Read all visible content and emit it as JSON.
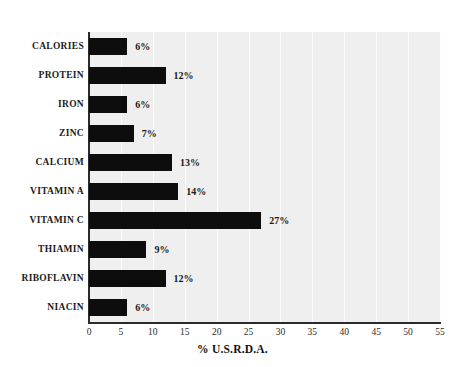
{
  "chart_data": {
    "type": "bar",
    "orientation": "horizontal",
    "title": "",
    "xlabel": "% U.S.R.D.A.",
    "ylabel": "",
    "xlim": [
      0,
      55
    ],
    "xticks": [
      0,
      5,
      10,
      15,
      20,
      25,
      30,
      35,
      40,
      45,
      50,
      55
    ],
    "grid": true,
    "grid_axis": "x",
    "legend": false,
    "categories": [
      "CALORIES",
      "PROTEIN",
      "IRON",
      "ZINC",
      "CALCIUM",
      "VITAMIN A",
      "VITAMIN C",
      "THIAMIN",
      "RIBOFLAVIN",
      "NIACIN"
    ],
    "values": [
      6,
      12,
      6,
      7,
      13,
      14,
      27,
      9,
      12,
      6
    ],
    "data_labels": [
      "6%",
      "12%",
      "6%",
      "7%",
      "13%",
      "14%",
      "27%",
      "9%",
      "12%",
      "6%"
    ],
    "colors": {
      "bar": "#0d0d0d",
      "plot_background": "#efefef",
      "gridline": "#fbfbfb",
      "axis": "#2b2b2b",
      "text": "#1a1a1a",
      "page_background": "#ffffff"
    }
  }
}
